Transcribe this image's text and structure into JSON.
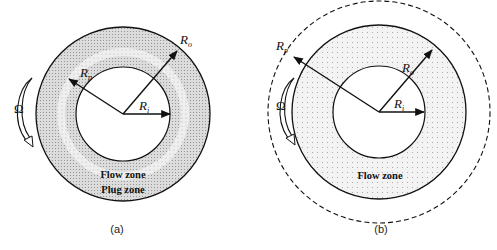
{
  "figure": {
    "panels": [
      {
        "id": "a",
        "caption": "(a)",
        "labels": {
          "outer_radius": {
            "main": "R",
            "sub": "o"
          },
          "plug_radius": {
            "main": "R",
            "sub": "p"
          },
          "inner_radius": {
            "main": "R",
            "sub": "i"
          },
          "rotation": "Ω",
          "zone_1": "Flow zone",
          "zone_2": "Plug zone"
        },
        "geometry": {
          "cx": 123,
          "cy": 114,
          "r_outer": 87,
          "r_plug": 64,
          "r_inner": 47
        }
      },
      {
        "id": "b",
        "caption": "(b)",
        "labels": {
          "outer_radius": {
            "main": "R",
            "sub": "o"
          },
          "plug_radius": {
            "main": "R",
            "sub": "p"
          },
          "inner_radius": {
            "main": "R",
            "sub": "i"
          },
          "rotation": "Ω",
          "zone_1": "Flow zone"
        },
        "geometry": {
          "cx": 379,
          "cy": 112,
          "r_outer": 87,
          "r_plug_dashed": 111,
          "r_inner": 46
        }
      }
    ],
    "colors": {
      "stroke": "#111111",
      "fill_flow": "#d8d8d8",
      "fill_plug": "#efefef",
      "dots": "#9a9a9a"
    }
  }
}
